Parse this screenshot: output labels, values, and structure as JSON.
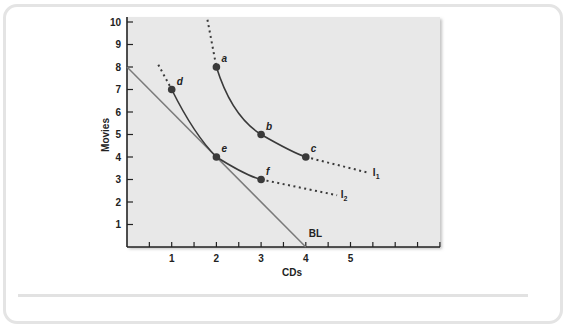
{
  "chart_data": {
    "type": "line",
    "title": "",
    "xlabel": "CDs",
    "ylabel": "Movies",
    "xlim": [
      0,
      7
    ],
    "ylim": [
      0,
      10
    ],
    "x_ticks": [
      1,
      2,
      3,
      4,
      5
    ],
    "y_ticks": [
      1,
      2,
      3,
      4,
      5,
      6,
      7,
      8,
      9,
      10
    ],
    "grid": false,
    "background": "#e8e8e8",
    "series": [
      {
        "name": "I1",
        "label_main": "I",
        "label_sub": "1",
        "style": "solid+dotted extensions",
        "points": [
          {
            "label": "a",
            "x": 2,
            "y": 8
          },
          {
            "label": "b",
            "x": 3,
            "y": 5
          },
          {
            "label": "c",
            "x": 4,
            "y": 4
          }
        ]
      },
      {
        "name": "I2",
        "label_main": "I",
        "label_sub": "2",
        "style": "solid+dotted extensions",
        "points": [
          {
            "label": "d",
            "x": 1,
            "y": 7
          },
          {
            "label": "e",
            "x": 2,
            "y": 4
          },
          {
            "label": "f",
            "x": 3,
            "y": 3
          }
        ]
      },
      {
        "name": "BL",
        "label": "BL",
        "style": "straight line",
        "points": [
          {
            "x": 0,
            "y": 8
          },
          {
            "x": 4,
            "y": 0
          }
        ]
      }
    ],
    "colors": {
      "curve": "#3a3a3a",
      "budget_line": "#7a7a7a",
      "point": "#3a3a3a"
    }
  }
}
